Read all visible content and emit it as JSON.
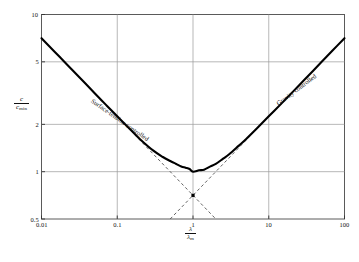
{
  "figure": {
    "name": "capillary-gravity-wave-speed",
    "background": "#ffffff",
    "ink": "#111111",
    "grid_color": "#9a9a9a",
    "curve_color": "#000000",
    "asymptote_color": "#555555"
  },
  "axes": {
    "x_label_num": "λ",
    "x_label_den": "λ",
    "x_label_den_sub": "m",
    "y_label_num": "c",
    "y_label_den": "c",
    "y_label_den_sub": "min"
  },
  "chart_data": {
    "type": "line",
    "title": "",
    "subtitle": "",
    "xlabel": "λ/λₘ",
    "ylabel": "c/cₘᵢₙ",
    "xscale": "log",
    "yscale": "log",
    "xlim": [
      0.01,
      100
    ],
    "ylim": [
      0.5,
      10
    ],
    "grid": true,
    "legend": "none",
    "xticks": [
      0.01,
      0.1,
      1,
      10,
      100
    ],
    "xtick_labels": [
      "0.01",
      "0.1",
      "1",
      "10",
      "100"
    ],
    "yticks": [
      0.5,
      1,
      2,
      5,
      10
    ],
    "ytick_labels": [
      "0.5",
      "1",
      "2",
      "5",
      "10"
    ],
    "series": [
      {
        "name": "c/c_min",
        "style": "solid",
        "comment": "c/cmin = sqrt( (x + 1/x) / 2 ), x = lambda/lambda_m",
        "x": [
          0.01,
          0.015,
          0.02,
          0.03,
          0.05,
          0.07,
          0.1,
          0.15,
          0.2,
          0.3,
          0.4,
          0.5,
          0.6,
          0.7,
          0.8,
          0.9,
          1.0,
          1.2,
          1.4,
          1.7,
          2.0,
          2.5,
          3.0,
          4.0,
          5.0,
          7.0,
          10.0,
          15.0,
          20.0,
          30.0,
          50.0,
          70.0,
          100.0
        ],
        "y": [
          7.07,
          5.78,
          5.01,
          4.09,
          3.17,
          2.68,
          2.25,
          1.85,
          1.61,
          1.36,
          1.24,
          1.17,
          1.12,
          1.08,
          1.06,
          1.04,
          1.0,
          1.02,
          1.03,
          1.08,
          1.12,
          1.21,
          1.29,
          1.46,
          1.61,
          1.89,
          2.25,
          2.74,
          3.16,
          3.87,
          5.0,
          5.92,
          7.07
        ]
      },
      {
        "name": "surface-tension asymptote",
        "style": "dashed",
        "comment": "c/cmin = 1/sqrt(2x)",
        "x": [
          0.01,
          0.1,
          1.0,
          2.0
        ],
        "y": [
          7.07,
          2.24,
          0.707,
          0.5
        ]
      },
      {
        "name": "gravity asymptote",
        "style": "dashed",
        "comment": "c/cmin = sqrt(x/2)",
        "x": [
          0.5,
          1.0,
          10.0,
          100.0
        ],
        "y": [
          0.5,
          0.707,
          2.24,
          7.07
        ]
      }
    ],
    "annotations": [
      {
        "id": "surface-tension-label",
        "text": "Surface-tension controlled",
        "x": 0.05,
        "y": 3.0,
        "rotation_deg": 35
      },
      {
        "id": "gravity-label",
        "text": "Gravity controlled",
        "x": 12,
        "y": 2.8,
        "rotation_deg": -37
      }
    ],
    "markers": [
      {
        "id": "asymptote-crossing",
        "x": 1.0,
        "y": 0.707
      }
    ]
  },
  "ticks": {
    "x": [
      "0.01",
      "0.1",
      "1",
      "10",
      "100"
    ],
    "y": [
      "10",
      "5",
      "2",
      "1",
      "0.5"
    ]
  },
  "annotations": {
    "left": "Surface-tension controlled",
    "right": "Gravity controlled"
  },
  "caption": ""
}
